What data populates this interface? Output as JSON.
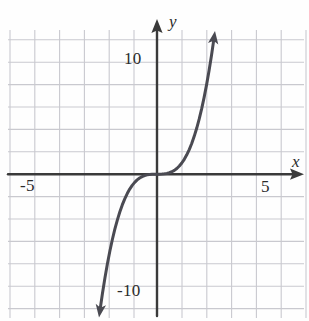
{
  "figure": {
    "name": "cubic-function-graph",
    "background_color": "#fefefe",
    "grid_color": "#c9c9cf",
    "axis_color": "#3a3a3a",
    "curve_color": "#4a4a52"
  },
  "labels": {
    "y_top": "10",
    "y_bottom": "-10",
    "x_left": "-5",
    "x_right": "5",
    "x_axis_name": "x",
    "y_axis_name": "y"
  },
  "chart_data": {
    "type": "line",
    "title": "",
    "xlabel": "x",
    "ylabel": "y",
    "xlim": [
      -6.3,
      6.1
    ],
    "ylim": [
      -12.0,
      12.0
    ],
    "xticks": [
      -5,
      5
    ],
    "xticklabels": [
      "-5",
      "5"
    ],
    "yticks": [
      10,
      -10
    ],
    "yticklabels": [
      "10",
      "-10"
    ],
    "grid": true,
    "grid_spacing_x": 1,
    "grid_spacing_y": 2,
    "legend": null,
    "annotations": [
      "arrowhead on positive x-axis",
      "arrowhead on positive y-axis",
      "arrowhead at upper end of curve",
      "arrowhead at lower end of curve"
    ],
    "series": [
      {
        "name": "y = x cubed",
        "equation": "y = x^3",
        "color": "#4a4a52",
        "x": [
          -2.3,
          -2.2,
          -2.1,
          -2.0,
          -1.9,
          -1.8,
          -1.7,
          -1.6,
          -1.5,
          -1.4,
          -1.3,
          -1.2,
          -1.1,
          -1.0,
          -0.9,
          -0.8,
          -0.7,
          -0.6,
          -0.5,
          -0.4,
          -0.3,
          -0.2,
          -0.1,
          0.0,
          0.1,
          0.2,
          0.3,
          0.4,
          0.5,
          0.6,
          0.7,
          0.8,
          0.9,
          1.0,
          1.1,
          1.2,
          1.3,
          1.4,
          1.5,
          1.6,
          1.7,
          1.8,
          1.9,
          2.0,
          2.1,
          2.2,
          2.3
        ],
        "y": [
          -12.17,
          -10.65,
          -9.26,
          -8.0,
          -6.86,
          -5.83,
          -4.91,
          -4.1,
          -3.38,
          -2.74,
          -2.2,
          -1.73,
          -1.33,
          -1.0,
          -0.73,
          -0.51,
          -0.34,
          -0.22,
          -0.13,
          -0.06,
          -0.03,
          -0.01,
          0.0,
          0.0,
          0.0,
          0.01,
          0.03,
          0.06,
          0.13,
          0.22,
          0.34,
          0.51,
          0.73,
          1.0,
          1.33,
          1.73,
          2.2,
          2.74,
          3.38,
          4.1,
          4.91,
          5.83,
          6.86,
          8.0,
          9.26,
          10.65,
          12.17
        ]
      }
    ]
  }
}
